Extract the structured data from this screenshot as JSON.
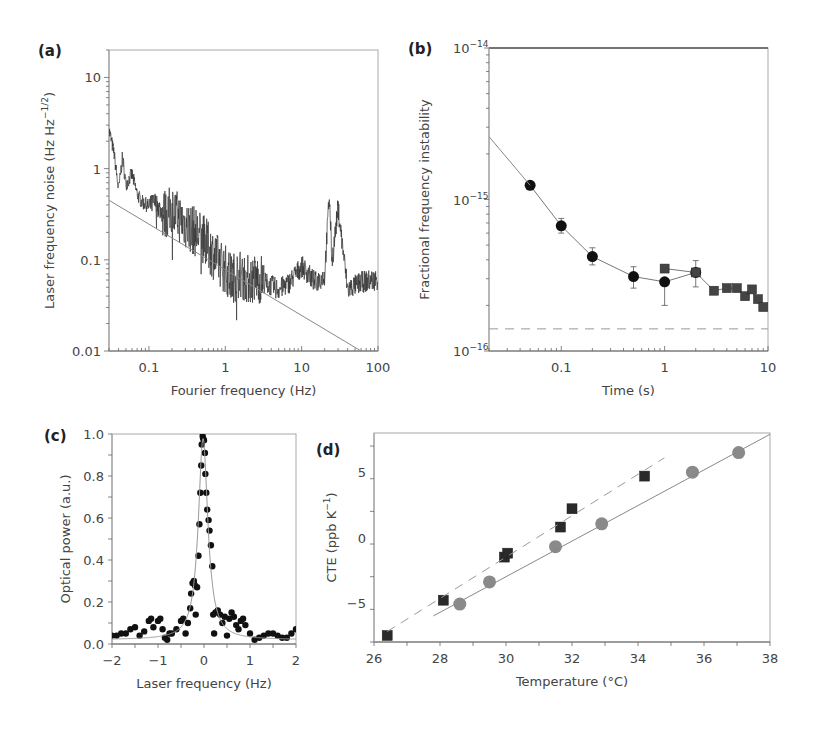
{
  "figure": {
    "panels": [
      "(a)",
      "(b)",
      "(c)",
      "(d)"
    ]
  },
  "chart_data": [
    {
      "panel": "(a)",
      "type": "line",
      "title": "",
      "xlabel": "Fourier frequency (Hz)",
      "ylabel": "Laser frequency noise (Hz Hz^-1/2)",
      "xscale": "log",
      "yscale": "log",
      "xlim": [
        0.03,
        100
      ],
      "ylim": [
        0.01,
        20
      ],
      "xticks": [
        "0.1",
        "1",
        "10",
        "100"
      ],
      "yticks": [
        "0.01",
        "0.1",
        "1",
        "10"
      ],
      "grid": false,
      "series": [
        {
          "name": "measured noise spectrum",
          "style": "noisy line",
          "x": [
            0.03,
            0.035,
            0.04,
            0.045,
            0.05,
            0.06,
            0.07,
            0.08,
            0.1,
            0.12,
            0.15,
            0.2,
            0.3,
            0.5,
            0.7,
            1.0,
            1.2,
            1.5,
            2.0,
            3.0,
            3.2,
            4,
            5,
            7,
            10,
            15,
            20,
            23,
            25,
            30,
            40,
            60,
            100
          ],
          "y": [
            2.8,
            1.5,
            0.6,
            1.4,
            0.7,
            0.9,
            0.55,
            0.45,
            0.4,
            0.45,
            0.35,
            0.4,
            0.28,
            0.2,
            0.13,
            0.09,
            0.07,
            0.08,
            0.07,
            0.07,
            0.06,
            0.055,
            0.05,
            0.06,
            0.09,
            0.06,
            0.07,
            0.55,
            0.1,
            0.4,
            0.05,
            0.06,
            0.065
          ]
        },
        {
          "name": "thermal noise limit (fit)",
          "style": "thin straight line",
          "x": [
            0.03,
            60
          ],
          "y": [
            0.45,
            0.01
          ]
        }
      ]
    },
    {
      "panel": "(b)",
      "type": "scatter",
      "title": "",
      "xlabel": "Time (s)",
      "ylabel": "Fractional frequency instability",
      "xscale": "log",
      "yscale": "log",
      "xlim": [
        0.02,
        10
      ],
      "ylim": [
        1e-16,
        1e-14
      ],
      "xticks": [
        "0.1",
        "1",
        "10"
      ],
      "yticks": [
        "10^-16",
        "10^-15",
        "10^-14"
      ],
      "grid": false,
      "series": [
        {
          "name": "circles",
          "marker": "circle",
          "x": [
            0.05,
            0.1,
            0.2,
            0.5,
            1,
            2
          ],
          "y": [
            1.24e-15,
            6.7e-16,
            4.2e-16,
            3.1e-16,
            2.86e-16,
            3.3e-16
          ],
          "yerr_low": [
            null,
            6e-16,
            3.7e-16,
            2.6e-16,
            2e-16,
            2.65e-16
          ],
          "yerr_high": [
            null,
            7.5e-16,
            4.8e-16,
            3.6e-16,
            null,
            3.95e-16
          ]
        },
        {
          "name": "squares",
          "marker": "square",
          "x": [
            1,
            2,
            3,
            4,
            5,
            6,
            7,
            8,
            9
          ],
          "y": [
            3.5e-16,
            3.3e-16,
            2.5e-16,
            2.6e-16,
            2.6e-16,
            2.3e-16,
            2.55e-16,
            2.2e-16,
            1.95e-16
          ]
        },
        {
          "name": "fit line (start)",
          "style": "solid line",
          "x": [
            0.02,
            0.05
          ],
          "y": [
            2.6e-15,
            1.24e-15
          ]
        },
        {
          "name": "thermal noise floor",
          "style": "dashed line",
          "x": [
            0.02,
            10
          ],
          "y": [
            1.4e-16,
            1.4e-16
          ]
        }
      ]
    },
    {
      "panel": "(c)",
      "type": "scatter",
      "title": "",
      "xlabel": "Laser frequency (Hz)",
      "ylabel": "Optical power (a.u.)",
      "xlim": [
        -2,
        2
      ],
      "ylim": [
        0,
        1.0
      ],
      "xticks": [
        "-2",
        "-1",
        "0",
        "1",
        "2"
      ],
      "yticks": [
        "0.0",
        "0.2",
        "0.4",
        "0.6",
        "0.8",
        "1.0"
      ],
      "grid": false,
      "series": [
        {
          "name": "measured",
          "marker": "circle",
          "x": [
            -2.0,
            -1.9,
            -1.8,
            -1.7,
            -1.6,
            -1.5,
            -1.4,
            -1.3,
            -1.2,
            -1.15,
            -1.1,
            -1.0,
            -0.95,
            -0.9,
            -0.85,
            -0.8,
            -0.75,
            -0.7,
            -0.6,
            -0.5,
            -0.45,
            -0.4,
            -0.35,
            -0.3,
            -0.28,
            -0.25,
            -0.22,
            -0.2,
            -0.18,
            -0.15,
            -0.12,
            -0.1,
            -0.08,
            -0.06,
            -0.05,
            -0.03,
            -0.02,
            0.0,
            0.02,
            0.03,
            0.05,
            0.07,
            0.1,
            0.12,
            0.15,
            0.18,
            0.2,
            0.22,
            0.25,
            0.3,
            0.35,
            0.4,
            0.45,
            0.5,
            0.55,
            0.6,
            0.65,
            0.7,
            0.75,
            0.8,
            0.85,
            0.9,
            1.0,
            1.1,
            1.2,
            1.3,
            1.4,
            1.5,
            1.6,
            1.7,
            1.8,
            1.9,
            2.0
          ],
          "y": [
            0.04,
            0.04,
            0.05,
            0.05,
            0.07,
            0.08,
            0.04,
            0.06,
            0.11,
            0.12,
            0.08,
            0.11,
            0.12,
            0.07,
            0.03,
            0.02,
            0.05,
            0.05,
            0.07,
            0.11,
            0.12,
            0.05,
            0.1,
            0.17,
            0.24,
            0.29,
            0.3,
            0.28,
            0.14,
            0.27,
            0.42,
            0.57,
            0.72,
            0.85,
            0.95,
            0.99,
            0.98,
            0.97,
            0.91,
            0.81,
            0.72,
            0.64,
            0.59,
            0.54,
            0.47,
            0.37,
            0.14,
            0.05,
            0.15,
            0.16,
            0.14,
            0.1,
            0.13,
            0.04,
            0.12,
            0.15,
            0.13,
            0.09,
            0.07,
            0.11,
            0.12,
            0.09,
            0.05,
            0.02,
            0.03,
            0.04,
            0.05,
            0.05,
            0.04,
            0.03,
            0.03,
            0.05,
            0.07
          ]
        },
        {
          "name": "Lorentzian fit",
          "style": "thin line",
          "center": -0.02,
          "peak": 0.98,
          "fwhm_hz": 0.25,
          "baseline": 0.02
        }
      ]
    },
    {
      "panel": "(d)",
      "type": "scatter",
      "title": "",
      "xlabel": "Temperature (°C)",
      "ylabel": "CTE (ppb K^-1)",
      "xlim": [
        26,
        38
      ],
      "ylim": [
        -8,
        8
      ],
      "xticks": [
        "26",
        "28",
        "30",
        "32",
        "34",
        "36",
        "38"
      ],
      "yticks": [
        "-5",
        "0",
        "5"
      ],
      "grid": false,
      "series": [
        {
          "name": "squares",
          "marker": "square",
          "color": "#2a2a2a",
          "x": [
            26.4,
            28.1,
            29.95,
            30.05,
            31.65,
            32.0,
            34.2
          ],
          "y": [
            -7.5,
            -4.8,
            -1.5,
            -1.2,
            0.8,
            2.2,
            4.7
          ]
        },
        {
          "name": "circles",
          "marker": "circle",
          "color": "#8a8a8a",
          "x": [
            28.6,
            29.5,
            31.5,
            32.9,
            35.65,
            37.05
          ],
          "y": [
            -5.1,
            -3.4,
            -0.7,
            1.05,
            5.0,
            6.5
          ]
        },
        {
          "name": "squares linear fit",
          "style": "dashed line",
          "x": [
            26.4,
            34.8
          ],
          "y": [
            -7.2,
            6.1
          ]
        },
        {
          "name": "circles linear fit",
          "style": "solid line",
          "x": [
            27.8,
            38.0
          ],
          "y": [
            -6.0,
            7.9
          ]
        }
      ]
    }
  ]
}
